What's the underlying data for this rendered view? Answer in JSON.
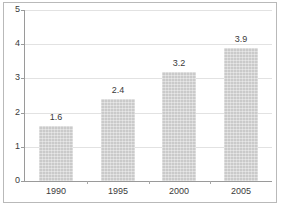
{
  "chart_data": {
    "type": "bar",
    "title": "",
    "subtitle": "",
    "xlabel": "",
    "ylabel": "",
    "categories": [
      "1990",
      "1995",
      "2000",
      "2005"
    ],
    "values": [
      1.6,
      2.4,
      3.2,
      3.9
    ],
    "data_labels": [
      "1.6",
      "2.4",
      "3.2",
      "3.9"
    ],
    "ylim": [
      0,
      5
    ],
    "yticks": [
      0,
      1,
      2,
      3,
      4,
      5
    ],
    "ytick_labels": [
      "0",
      "1",
      "2",
      "3",
      "4",
      "5"
    ],
    "grid": true,
    "grid_axis": "y",
    "legend": false,
    "legend_position": "none",
    "series": [
      {
        "name": "",
        "values": [
          1.6,
          2.4,
          3.2,
          3.9
        ]
      }
    ],
    "colors": {
      "bar_fill": "#cacaca",
      "gridline": "#e2e2e2",
      "axis_line": "#9a9a9a",
      "text": "#3a3a3a",
      "background": "#ffffff",
      "frame": "#b9b9b9"
    }
  }
}
